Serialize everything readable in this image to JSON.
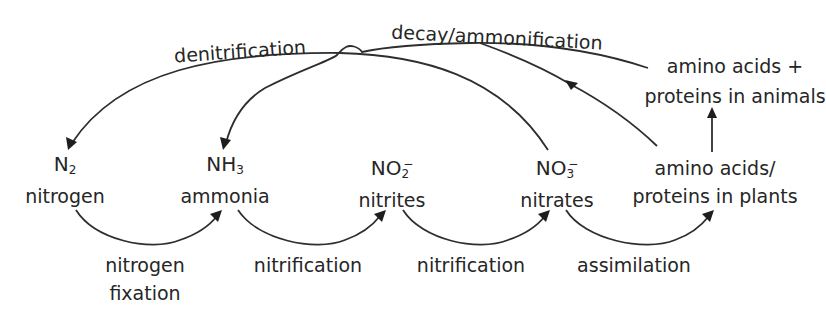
{
  "diagram": {
    "nodes": {
      "n2": {
        "formula": "N",
        "sub": "2",
        "sup": "",
        "name": "nitrogen"
      },
      "nh3": {
        "formula": "NH",
        "sub": "3",
        "sup": "",
        "name": "ammonia"
      },
      "no2": {
        "formula": "NO",
        "sub": "2",
        "sup": "−",
        "name": "nitrites"
      },
      "no3": {
        "formula": "NO",
        "sub": "3",
        "sup": "−",
        "name": "nitrates"
      },
      "plants": {
        "line1": "amino acids/",
        "line2": "proteins in plants"
      },
      "animals": {
        "line1": "amino acids +",
        "line2": "proteins in animals"
      }
    },
    "processes": {
      "nitrogen_fixation": {
        "line1": "nitrogen",
        "line2": "fixation"
      },
      "nitrification_1": "nitrification",
      "nitrification_2": "nitrification",
      "assimilation": "assimilation",
      "denitrification": "denitrification",
      "decay": "decay/ammonification"
    },
    "edges": [
      {
        "from": "N2",
        "to": "NH3",
        "label": "nitrogen fixation"
      },
      {
        "from": "NH3",
        "to": "NO2-",
        "label": "nitrification"
      },
      {
        "from": "NO2-",
        "to": "NO3-",
        "label": "nitrification"
      },
      {
        "from": "NO3-",
        "to": "amino acids/proteins in plants",
        "label": "assimilation"
      },
      {
        "from": "amino acids/proteins in plants",
        "to": "amino acids + proteins in animals",
        "label": ""
      },
      {
        "from": "NO3-",
        "to": "N2",
        "label": "denitrification"
      },
      {
        "from": "amino acids + proteins in animals",
        "to": "NH3",
        "label": "decay/ammonification"
      },
      {
        "from": "amino acids/proteins in plants",
        "to": "NH3",
        "label": "decay/ammonification"
      }
    ],
    "colors": {
      "ink": "#262626",
      "background": "#ffffff"
    }
  }
}
